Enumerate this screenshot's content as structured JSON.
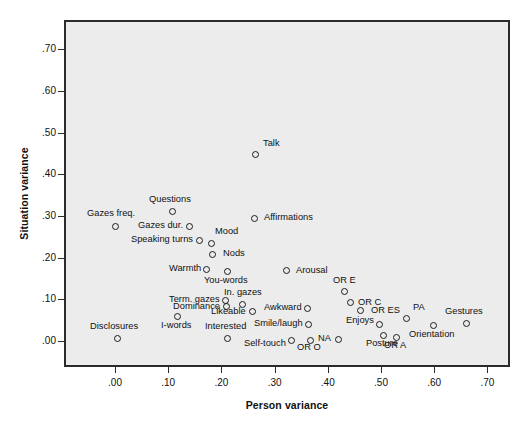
{
  "chart_data": {
    "type": "scatter",
    "title": "",
    "xlabel": "Person variance",
    "ylabel": "Situation variance",
    "xlim": [
      -0.035,
      0.745
    ],
    "ylim": [
      -0.025,
      0.785
    ],
    "xticks": [
      ".00",
      ".10",
      ".20",
      ".30",
      ".40",
      ".50",
      ".60",
      ".70"
    ],
    "xtick_values": [
      0.0,
      0.1,
      0.2,
      0.3,
      0.4,
      0.5,
      0.6,
      0.7
    ],
    "yticks": [
      ".00",
      ".10",
      ".20",
      ".30",
      ".40",
      ".50",
      ".60",
      ".70"
    ],
    "ytick_values": [
      0.0,
      0.1,
      0.2,
      0.3,
      0.4,
      0.5,
      0.6,
      0.7
    ],
    "grid": false,
    "legend": "none",
    "plot_background": "#ececec",
    "marker_color": "#1c1c1c",
    "points": [
      {
        "label": "Gazes freq.",
        "x": 0.0,
        "y": 0.275,
        "lx": -4,
        "ly": -13,
        "anchor": "center"
      },
      {
        "label": "Disclosures",
        "x": 0.005,
        "y": 0.005,
        "lx": -4,
        "ly": -13,
        "anchor": "center"
      },
      {
        "label": "Questions",
        "x": 0.108,
        "y": 0.31,
        "lx": -2,
        "ly": -13,
        "anchor": "center"
      },
      {
        "label": "Gazes dur.",
        "x": 0.14,
        "y": 0.275,
        "lx": -6,
        "ly": -1,
        "anchor": "left"
      },
      {
        "label": "Speaking turns",
        "x": 0.158,
        "y": 0.242,
        "lx": -6,
        "ly": -1,
        "anchor": "left"
      },
      {
        "label": "Mood",
        "x": 0.182,
        "y": 0.235,
        "lx": 3,
        "ly": -12,
        "anchor": "right"
      },
      {
        "label": "Nods",
        "x": 0.184,
        "y": 0.208,
        "lx": 10,
        "ly": -1,
        "anchor": "right"
      },
      {
        "label": "Warmth",
        "x": 0.172,
        "y": 0.172,
        "lx": -6,
        "ly": -1,
        "anchor": "left"
      },
      {
        "label": "You-words",
        "x": 0.212,
        "y": 0.166,
        "lx": -2,
        "ly": 8,
        "anchor": "center"
      },
      {
        "label": "I-words",
        "x": 0.118,
        "y": 0.058,
        "lx": -2,
        "ly": 8,
        "anchor": "center"
      },
      {
        "label": "Term. gazes",
        "x": 0.208,
        "y": 0.098,
        "lx": -6,
        "ly": -1,
        "anchor": "left"
      },
      {
        "label": "Dominance",
        "x": 0.209,
        "y": 0.082,
        "lx": -6,
        "ly": -1,
        "anchor": "left"
      },
      {
        "label": "In. gazes",
        "x": 0.24,
        "y": 0.088,
        "lx": 0,
        "ly": -12,
        "anchor": "center"
      },
      {
        "label": "Likeable",
        "x": 0.258,
        "y": 0.07,
        "lx": -6,
        "ly": -1,
        "anchor": "left"
      },
      {
        "label": "Interested",
        "x": 0.212,
        "y": 0.006,
        "lx": -2,
        "ly": -12,
        "anchor": "center"
      },
      {
        "label": "Self-touch",
        "x": 0.332,
        "y": 0.002,
        "lx": -6,
        "ly": 3,
        "anchor": "left"
      },
      {
        "label": "Talk",
        "x": 0.265,
        "y": 0.448,
        "lx": 7,
        "ly": -11,
        "anchor": "right"
      },
      {
        "label": "Affirmations",
        "x": 0.262,
        "y": 0.294,
        "lx": 10,
        "ly": -1,
        "anchor": "right"
      },
      {
        "label": "Arousal",
        "x": 0.322,
        "y": 0.168,
        "lx": 10,
        "ly": -1,
        "anchor": "right"
      },
      {
        "label": "Awkward",
        "x": 0.362,
        "y": 0.078,
        "lx": -6,
        "ly": -1,
        "anchor": "left"
      },
      {
        "label": "Smile/laugh",
        "x": 0.364,
        "y": 0.04,
        "lx": -6,
        "ly": -1,
        "anchor": "left"
      },
      {
        "label": "OR O",
        "x": 0.368,
        "y": 0.002,
        "lx": -2,
        "ly": 7,
        "anchor": "center"
      },
      {
        "label": "NA",
        "x": 0.42,
        "y": 0.004,
        "lx": -7,
        "ly": -1,
        "anchor": "left"
      },
      {
        "label": "OR E",
        "x": 0.432,
        "y": 0.118,
        "lx": 0,
        "ly": -12,
        "anchor": "center"
      },
      {
        "label": "OR C",
        "x": 0.442,
        "y": 0.092,
        "lx": 8,
        "ly": -1,
        "anchor": "right"
      },
      {
        "label": "OR ES",
        "x": 0.462,
        "y": 0.072,
        "lx": 10,
        "ly": -1,
        "anchor": "right"
      },
      {
        "label": "Enjoys",
        "x": 0.498,
        "y": 0.04,
        "lx": -6,
        "ly": -4,
        "anchor": "left"
      },
      {
        "label": "Posture",
        "x": 0.505,
        "y": 0.012,
        "lx": -2,
        "ly": 7,
        "anchor": "center"
      },
      {
        "label": "OR A",
        "x": 0.53,
        "y": 0.008,
        "lx": -2,
        "ly": 7,
        "anchor": "center"
      },
      {
        "label": "PA",
        "x": 0.548,
        "y": 0.055,
        "lx": 6,
        "ly": -11,
        "anchor": "right"
      },
      {
        "label": "Orientation",
        "x": 0.598,
        "y": 0.036,
        "lx": -2,
        "ly": 8,
        "anchor": "center"
      },
      {
        "label": "Gestures",
        "x": 0.66,
        "y": 0.042,
        "lx": -2,
        "ly": -12,
        "anchor": "center"
      }
    ]
  }
}
